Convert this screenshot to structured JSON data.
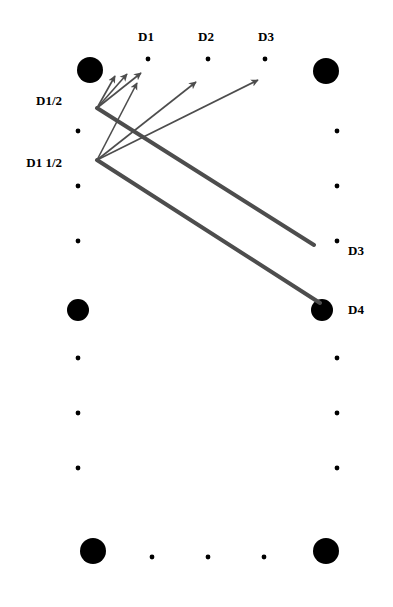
{
  "diagram": {
    "table": {
      "frame": {
        "x": 66,
        "y": 45,
        "width": 264,
        "height": 519
      },
      "cushion_inset": 12,
      "rail_color": "#000000",
      "cloth_color": "#ffffff",
      "pocket_color": "#000000",
      "frame_stroke": "#1a1a1a"
    },
    "labels": {
      "top": [
        {
          "name": "D1",
          "text": "D1",
          "x": 146,
          "y": 30
        },
        {
          "name": "D2",
          "text": "D2",
          "x": 206,
          "y": 30
        },
        {
          "name": "D3",
          "text": "D3",
          "x": 266,
          "y": 30
        }
      ],
      "left": [
        {
          "name": "D1/2",
          "text": "D1/2",
          "x": 62,
          "y": 94
        },
        {
          "name": "D1 1/2",
          "text": "D1 1/2",
          "x": 62,
          "y": 156
        }
      ],
      "right": [
        {
          "name": "D3",
          "text": "D3",
          "x": 348,
          "y": 244
        },
        {
          "name": "D4",
          "text": "D4",
          "x": 348,
          "y": 303
        }
      ]
    },
    "pockets": [
      {
        "name": "top-left-pocket",
        "cx": 90,
        "cy": 70,
        "r": 13
      },
      {
        "name": "top-right-pocket",
        "cx": 326,
        "cy": 71,
        "r": 13
      },
      {
        "name": "middle-left-pocket",
        "cx": 78,
        "cy": 310,
        "r": 11
      },
      {
        "name": "middle-right-pocket",
        "cx": 322,
        "cy": 310,
        "r": 11
      },
      {
        "name": "bottom-left-pocket",
        "cx": 93,
        "cy": 551,
        "r": 13
      },
      {
        "name": "bottom-right-pocket",
        "cx": 326,
        "cy": 551,
        "r": 13
      }
    ],
    "diamonds": {
      "top": [
        {
          "cx": 148,
          "cy": 59
        },
        {
          "cx": 208,
          "cy": 59
        },
        {
          "cx": 265,
          "cy": 59
        }
      ],
      "bottom": [
        {
          "cx": 152,
          "cy": 557
        },
        {
          "cx": 208,
          "cy": 557
        },
        {
          "cx": 264,
          "cy": 557
        }
      ],
      "left": [
        {
          "cx": 78,
          "cy": 131
        },
        {
          "cx": 78,
          "cy": 186
        },
        {
          "cx": 78,
          "cy": 241
        },
        {
          "cx": 78,
          "cy": 358
        },
        {
          "cx": 78,
          "cy": 413
        },
        {
          "cx": 78,
          "cy": 468
        }
      ],
      "right": [
        {
          "cx": 337,
          "cy": 131
        },
        {
          "cx": 337,
          "cy": 186
        },
        {
          "cx": 337,
          "cy": 241
        },
        {
          "cx": 337,
          "cy": 358
        },
        {
          "cx": 337,
          "cy": 413
        },
        {
          "cx": 337,
          "cy": 468
        }
      ]
    },
    "shots": {
      "origin_upper": {
        "name": "cue-origin-d-half",
        "x": 97,
        "y": 108
      },
      "origin_lower": {
        "name": "cue-origin-d-one-half",
        "x": 97,
        "y": 160
      },
      "thin_arrows": [
        {
          "name": "arrow-1",
          "from": "origin_upper",
          "x1": 97,
          "y1": 108,
          "x2": 115,
          "y2": 76
        },
        {
          "name": "arrow-2",
          "from": "origin_upper",
          "x1": 97,
          "y1": 108,
          "x2": 127,
          "y2": 74
        },
        {
          "name": "arrow-3",
          "from": "origin_upper",
          "x1": 97,
          "y1": 108,
          "x2": 141,
          "y2": 73
        },
        {
          "name": "arrow-4",
          "from": "origin_lower",
          "x1": 97,
          "y1": 160,
          "x2": 137,
          "y2": 83
        },
        {
          "name": "arrow-5",
          "from": "origin_lower",
          "x1": 97,
          "y1": 160,
          "x2": 196,
          "y2": 82
        },
        {
          "name": "arrow-6",
          "from": "origin_lower",
          "x1": 97,
          "y1": 160,
          "x2": 258,
          "y2": 80
        }
      ],
      "thick_lines": [
        {
          "name": "thick-line-to-d3",
          "x1": 97,
          "y1": 108,
          "x2": 314,
          "y2": 245
        },
        {
          "name": "thick-line-to-d4",
          "x1": 97,
          "y1": 160,
          "x2": 320,
          "y2": 303
        }
      ],
      "line_color": "#4d4d4d",
      "thick_width": 4,
      "thin_width": 1.6
    }
  }
}
